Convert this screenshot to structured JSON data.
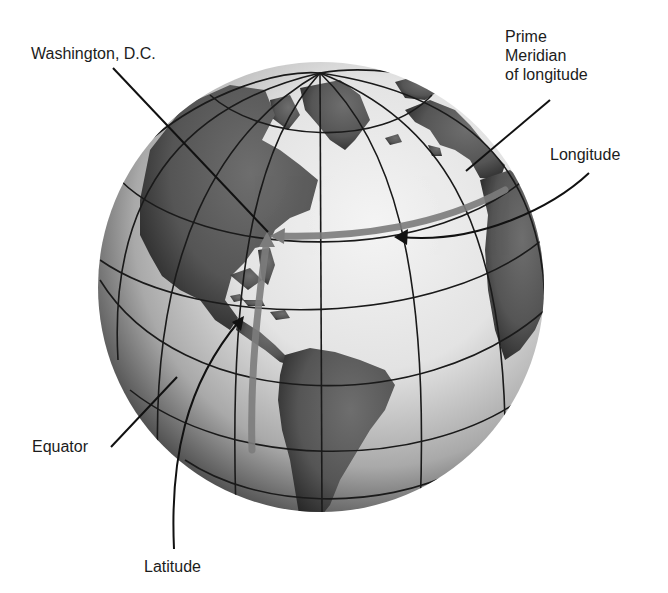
{
  "figure": {
    "colors": {
      "background": "#ffffff",
      "ocean_light": "#efefef",
      "ocean_shadow": "#3a3a3a",
      "land": "#5a5a5a",
      "grid_line": "#1a1a1a",
      "highlight_band": "#7c7c7c",
      "label_text": "#1c1c1c"
    }
  },
  "labels": {
    "washington": "Washington, D.C.",
    "prime_meridian": [
      "Prime",
      "Meridian",
      "of longitude"
    ],
    "longitude": "Longitude",
    "equator": "Equator",
    "latitude": "Latitude"
  }
}
